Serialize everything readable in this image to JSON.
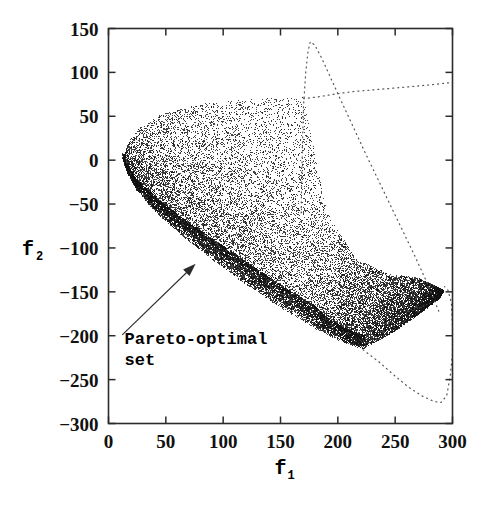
{
  "figure": {
    "kind": "scatter-plot",
    "background_color": "#ffffff",
    "ink_color": "#000000"
  },
  "chart_data": {
    "type": "scatter",
    "title": "",
    "subtitle": "",
    "xlabel": "f_1",
    "ylabel": "f_2",
    "xlabel_display": "f",
    "xlabel_subscript": "1",
    "ylabel_display": "f",
    "ylabel_subscript": "2",
    "xlim": [
      0,
      300
    ],
    "ylim": [
      -300,
      150
    ],
    "xticks": [
      0,
      50,
      100,
      150,
      200,
      250,
      300
    ],
    "yticks": [
      150,
      100,
      50,
      0,
      -50,
      -100,
      -150,
      -200,
      -250,
      -300
    ],
    "xtick_labels": [
      "0",
      "50",
      "100",
      "150",
      "200",
      "250",
      "300"
    ],
    "ytick_labels": [
      "150",
      "100",
      "50",
      "0",
      "-50",
      "-100",
      "-150",
      "-200",
      "-250",
      "-300"
    ],
    "grid": false,
    "legend": null,
    "legend_position": "none",
    "point_count_approx": 24000,
    "point_color": "#111111",
    "point_size": 0.8,
    "annotations": [
      {
        "text_line1": "Pareto-optimal",
        "text_line2": "set",
        "text": "Pareto-optimal set",
        "text_x": 14,
        "text_y": -203,
        "arrow_from_x": 12,
        "arrow_from_y": -199,
        "arrow_to_x": 76,
        "arrow_to_y": -118
      }
    ],
    "series": [
      {
        "name": "feasible objective space",
        "style": "dense-scatter-cloud",
        "description": "Crescent / wedge shaped cloud of feasible solutions in objective space; the lower-left boundary is a dense dark band which is the Pareto-optimal front.",
        "boundary_upper": [
          [
            12,
            2
          ],
          [
            18,
            22
          ],
          [
            28,
            38
          ],
          [
            42,
            50
          ],
          [
            60,
            58
          ],
          [
            82,
            64
          ],
          [
            108,
            68
          ],
          [
            132,
            70
          ],
          [
            152,
            71
          ],
          [
            168,
            72
          ],
          [
            170,
            72
          ]
        ],
        "boundary_right_upper": [
          [
            170,
            72
          ],
          [
            170,
            10
          ],
          [
            170,
            -40
          ],
          [
            172,
            -80
          ],
          [
            176,
            -105
          ]
        ],
        "boundary_lower_pareto": [
          [
            12,
            2
          ],
          [
            16,
            -14
          ],
          [
            24,
            -34
          ],
          [
            40,
            -58
          ],
          [
            62,
            -84
          ],
          [
            90,
            -113
          ],
          [
            120,
            -142
          ],
          [
            150,
            -168
          ],
          [
            180,
            -192
          ],
          [
            205,
            -208
          ],
          [
            222,
            -215
          ]
        ],
        "boundary_lower_right": [
          [
            222,
            -215
          ],
          [
            248,
            -196
          ],
          [
            270,
            -176
          ],
          [
            286,
            -160
          ],
          [
            292,
            -150
          ]
        ],
        "boundary_far_right": [
          [
            292,
            -150
          ],
          [
            294,
            -140
          ],
          [
            288,
            -134
          ],
          [
            270,
            -132
          ],
          [
            245,
            -133
          ],
          [
            215,
            -137
          ],
          [
            190,
            -142
          ],
          [
            176,
            -146
          ]
        ],
        "dark_band_note": "Dense black stripe hugging boundary_lower_pareto from (12,2) to about (222,-215)"
      },
      {
        "name": "boundary curve A (dotted)",
        "style": "dotted",
        "points": [
          [
            168,
            -60
          ],
          [
            169,
            10
          ],
          [
            170,
            60
          ],
          [
            172,
            100
          ],
          [
            174,
            124
          ],
          [
            176,
            135
          ],
          [
            180,
            131
          ],
          [
            186,
            116
          ],
          [
            193,
            96
          ],
          [
            202,
            70
          ],
          [
            212,
            42
          ],
          [
            224,
            8
          ],
          [
            238,
            -30
          ],
          [
            252,
            -68
          ],
          [
            266,
            -106
          ],
          [
            278,
            -140
          ],
          [
            288,
            -172
          ]
        ]
      },
      {
        "name": "boundary curve B (dotted, near-horizontal)",
        "style": "dotted",
        "points": [
          [
            170,
            70
          ],
          [
            182,
            72
          ],
          [
            196,
            75
          ],
          [
            212,
            78
          ],
          [
            230,
            80
          ],
          [
            248,
            82
          ],
          [
            266,
            84
          ],
          [
            282,
            86
          ],
          [
            296,
            88
          ],
          [
            300,
            89
          ]
        ]
      },
      {
        "name": "boundary curve C (dotted, lower lobe)",
        "style": "dotted",
        "points": [
          [
            222,
            -216
          ],
          [
            236,
            -230
          ],
          [
            250,
            -246
          ],
          [
            262,
            -259
          ],
          [
            274,
            -269
          ],
          [
            284,
            -275
          ],
          [
            290,
            -276
          ],
          [
            295,
            -268
          ],
          [
            298,
            -246
          ],
          [
            300,
            -220
          ],
          [
            300,
            -190
          ],
          [
            299,
            -162
          ],
          [
            296,
            -148
          ],
          [
            293,
            -144
          ]
        ]
      }
    ]
  },
  "axes": {
    "frame_color": "#2b2b2b",
    "tick_direction": "in",
    "x_axis_name": "f1-axis",
    "y_axis_name": "f2-axis"
  }
}
